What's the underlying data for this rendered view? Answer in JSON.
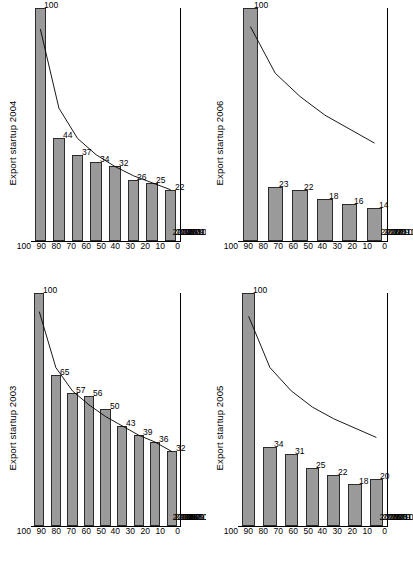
{
  "figure": {
    "panel_count": 4,
    "axis_ticks": [
      "100",
      "90",
      "80",
      "70",
      "60",
      "50",
      "40",
      "30",
      "20",
      "10",
      "0"
    ],
    "bar_color": "#9a9a9a",
    "bar_border_color": "#2b2b2b",
    "line_color": "#000000"
  },
  "chart_data": [
    {
      "type": "bar",
      "title": "Export startup 2004",
      "categories": [
        "2004",
        "2005",
        "2006",
        "2007",
        "2008",
        "2009",
        "2010",
        "2011"
      ],
      "values": [
        100,
        44,
        37,
        34,
        32,
        26,
        25,
        22
      ],
      "labels": [
        "100",
        "44",
        "37",
        "34",
        "32",
        "26",
        "25",
        "22"
      ],
      "line_series": {
        "name": "survival curve",
        "x": [
          "2004",
          "2005",
          "2006",
          "2007",
          "2008",
          "2009",
          "2010",
          "2011"
        ],
        "values": [
          91,
          57,
          44,
          37,
          32,
          28,
          25,
          22
        ]
      },
      "xlabel": "",
      "ylabel": "",
      "ylim": [
        0,
        100
      ],
      "yticks": [
        "100",
        "90",
        "80",
        "70",
        "60",
        "50",
        "40",
        "30",
        "20",
        "10",
        "0"
      ],
      "grid": false,
      "legend": "none"
    },
    {
      "type": "bar",
      "title": "Export startup 2006",
      "categories": [
        "2006",
        "2007",
        "2008",
        "2009",
        "2010",
        "2011"
      ],
      "values": [
        100,
        23,
        22,
        18,
        16,
        14
      ],
      "labels": [
        "100",
        "23",
        "22",
        "18",
        "16",
        "14"
      ],
      "line_series": {
        "name": "survival curve",
        "x": [
          "2006",
          "2007",
          "2008",
          "2009",
          "2010",
          "2011"
        ],
        "values": [
          92,
          72,
          62,
          54,
          48,
          42
        ]
      },
      "xlabel": "",
      "ylabel": "",
      "ylim": [
        0,
        100
      ],
      "yticks": [
        "100",
        "90",
        "80",
        "70",
        "60",
        "50",
        "40",
        "30",
        "20",
        "10",
        "0"
      ],
      "grid": false,
      "legend": "none"
    },
    {
      "type": "bar",
      "title": "Export startup 2003",
      "categories": [
        "2003",
        "2004",
        "2005",
        "2006",
        "2007",
        "2008",
        "2009",
        "2010",
        "2011"
      ],
      "values": [
        100,
        65,
        57,
        56,
        50,
        43,
        39,
        36,
        32
      ],
      "labels": [
        "100",
        "65",
        "57",
        "56",
        "50",
        "43",
        "39",
        "36",
        "32"
      ],
      "line_series": {
        "name": "survival curve",
        "x": [
          "2003",
          "2004",
          "2005",
          "2006",
          "2007",
          "2008",
          "2009",
          "2010",
          "2011"
        ],
        "values": [
          92,
          68,
          58,
          52,
          47,
          43,
          39,
          36,
          32
        ]
      },
      "xlabel": "",
      "ylabel": "",
      "ylim": [
        0,
        100
      ],
      "yticks": [
        "100",
        "90",
        "80",
        "70",
        "60",
        "50",
        "40",
        "30",
        "20",
        "10",
        "0"
      ],
      "grid": false,
      "legend": "none"
    },
    {
      "type": "bar",
      "title": "Export startup 2005",
      "categories": [
        "2005",
        "2006",
        "2007",
        "2008",
        "2009",
        "2010",
        "2011"
      ],
      "values": [
        100,
        34,
        31,
        25,
        22,
        18,
        20
      ],
      "labels": [
        "100",
        "34",
        "31",
        "25",
        "22",
        "18",
        "20"
      ],
      "line_series": {
        "name": "survival curve",
        "x": [
          "2005",
          "2006",
          "2007",
          "2008",
          "2009",
          "2010",
          "2011"
        ],
        "values": [
          90,
          68,
          58,
          51,
          46,
          42,
          38
        ]
      },
      "xlabel": "",
      "ylabel": "",
      "ylim": [
        0,
        100
      ],
      "yticks": [
        "100",
        "90",
        "80",
        "70",
        "60",
        "50",
        "40",
        "30",
        "20",
        "10",
        "0"
      ],
      "grid": false,
      "legend": "none"
    }
  ]
}
